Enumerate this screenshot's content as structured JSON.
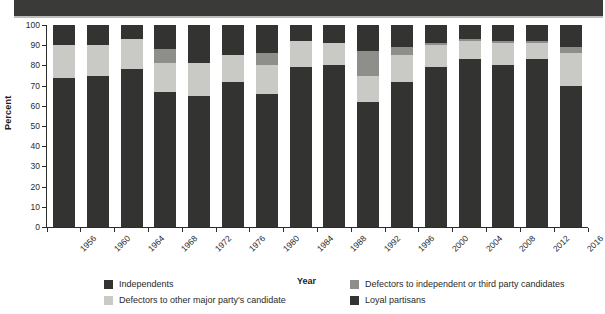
{
  "chart_data": {
    "type": "bar",
    "subtype": "stacked-bar-100",
    "title": "",
    "xlabel": "Year",
    "ylabel": "Percent",
    "ylim": [
      0,
      100
    ],
    "yticks": [
      0,
      10,
      20,
      30,
      40,
      50,
      60,
      70,
      80,
      90,
      100
    ],
    "grid": false,
    "legend_position": "bottom",
    "categories": [
      "1956",
      "1960",
      "1964",
      "1968",
      "1972",
      "1976",
      "1980",
      "1984",
      "1988",
      "1992",
      "1996",
      "2000",
      "2004",
      "2008",
      "2012",
      "2016"
    ],
    "series": [
      {
        "name": "Loyal partisans",
        "color": "#333331",
        "values": [
          74,
          75,
          78,
          67,
          65,
          72,
          66,
          79,
          80,
          62,
          72,
          79,
          83,
          80,
          83,
          70
        ]
      },
      {
        "name": "Defectors to other major party's candidate",
        "color": "#c9c9c5",
        "values": [
          16,
          15,
          15,
          14,
          16,
          13,
          14,
          13,
          11,
          13,
          13,
          11,
          9,
          11,
          8,
          16
        ]
      },
      {
        "name": "Defectors to independent or third party candidates",
        "color": "#8e8e8a",
        "values": [
          0,
          0,
          0,
          7,
          0,
          0,
          6,
          0,
          0,
          12,
          4,
          1,
          1,
          1,
          1,
          3
        ]
      },
      {
        "name": "Independents",
        "color": "#333331",
        "values": [
          10,
          10,
          7,
          12,
          19,
          15,
          14,
          8,
          9,
          13,
          11,
          9,
          7,
          8,
          8,
          11
        ]
      }
    ]
  },
  "axes": {
    "y_title": "Percent",
    "x_title": "Year"
  },
  "legend": {
    "items": [
      {
        "label": "Independents",
        "color": "#333331"
      },
      {
        "label": "Defectors to independent or third party candidates",
        "color": "#8e8e8a"
      },
      {
        "label": "Defectors to other major party's candidate",
        "color": "#c9c9c5"
      },
      {
        "label": "Loyal partisans",
        "color": "#333331"
      }
    ]
  }
}
